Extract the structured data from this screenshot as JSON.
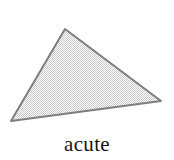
{
  "figure": {
    "kind": "geometry-figure",
    "shape_name": "triangle",
    "caption": "acute",
    "background_color": "#ffffff",
    "outline_color": "#7e7e7e",
    "outline_width_px": 2,
    "fill_description": "light gray dithered checkerboard halftone",
    "fill_color_light": "#ffffff",
    "fill_color_dark": "#c9c9c9",
    "fill_average_color": "#d6d6d6",
    "vertices": [
      {
        "label": "apex",
        "x": 65,
        "y": 29
      },
      {
        "label": "bottom-left",
        "x": 11,
        "y": 121
      },
      {
        "label": "right",
        "x": 161,
        "y": 101
      }
    ],
    "caption_color": "#151515",
    "caption_font_size_px": 21
  },
  "chart_data": {
    "type": "scatter",
    "title": "acute",
    "xlabel": "",
    "ylabel": "",
    "x": [
      65,
      11,
      161,
      65
    ],
    "y": [
      29,
      121,
      101,
      29
    ],
    "series": [
      {
        "name": "triangle-outline",
        "x": [
          65,
          11,
          161,
          65
        ],
        "y": [
          29,
          121,
          101,
          29
        ]
      }
    ],
    "annotations": [
      "acute"
    ],
    "xlim": [
      0,
      174
    ],
    "ylim": [
      0,
      160
    ],
    "grid": false,
    "legend": "none"
  }
}
